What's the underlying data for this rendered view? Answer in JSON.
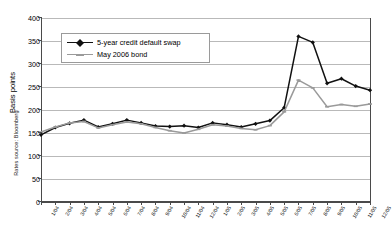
{
  "source_note": "Rates source: Bloomberg",
  "axes": {
    "y_title": "Basis points",
    "y_ticks": [
      0,
      50,
      100,
      150,
      200,
      250,
      300,
      350,
      400
    ],
    "x_ticks": [
      "1/04",
      "2/04",
      "3/04",
      "4/04",
      "5/04",
      "6/04",
      "7/04",
      "8/04",
      "9/04",
      "10/04",
      "11/04",
      "12/04",
      "1/05",
      "2/05",
      "3/05",
      "4/05",
      "5/05",
      "6/05",
      "7/05",
      "8/05",
      "9/05",
      "10/05",
      "11/05",
      "12/05"
    ]
  },
  "legend": {
    "position": "top-left-inside",
    "entries": [
      {
        "label": "5-year credit default swap",
        "color": "#111111",
        "marker": "diamond"
      },
      {
        "label": "May 2006 bond",
        "color": "#9a9a9a",
        "marker": "dash"
      }
    ]
  },
  "chart_data": {
    "type": "line",
    "title": "",
    "xlabel": "",
    "ylabel": "Basis points",
    "ylim": [
      0,
      400
    ],
    "ytick_step": 50,
    "grid": true,
    "x": [
      "1/04",
      "2/04",
      "3/04",
      "4/04",
      "5/04",
      "6/04",
      "7/04",
      "8/04",
      "9/04",
      "10/04",
      "11/04",
      "12/04",
      "1/05",
      "2/05",
      "3/05",
      "4/05",
      "5/05",
      "6/05",
      "7/05",
      "8/05",
      "9/05",
      "10/05",
      "11/05",
      "12/05"
    ],
    "series": [
      {
        "name": "5-year credit default swap",
        "color": "#111111",
        "values": [
          146,
          162,
          171,
          178,
          163,
          170,
          178,
          172,
          165,
          164,
          166,
          162,
          172,
          168,
          163,
          170,
          177,
          205,
          360,
          347,
          258,
          268,
          252,
          243
        ]
      },
      {
        "name": "May 2006 bond",
        "color": "#9a9a9a",
        "values": [
          152,
          163,
          172,
          175,
          161,
          168,
          174,
          170,
          162,
          155,
          150,
          158,
          168,
          165,
          160,
          157,
          166,
          196,
          265,
          248,
          207,
          212,
          208,
          213
        ]
      }
    ]
  }
}
